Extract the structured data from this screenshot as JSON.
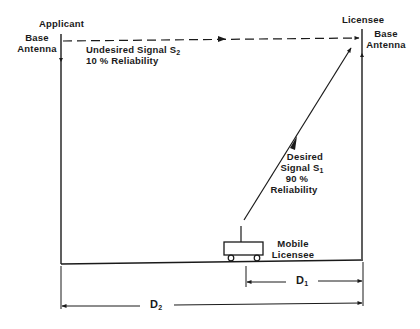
{
  "figure": {
    "applicant": {
      "title": "Applicant",
      "line1": "Base",
      "line2": "Antenna"
    },
    "licensee": {
      "title": "Licensee",
      "line1": "Base",
      "line2": "Antenna"
    },
    "undesired_signal": {
      "label": "Undesired Signal S",
      "subscript": "2",
      "reliability": "10 % Reliability"
    },
    "desired_signal": {
      "line1": "Desired",
      "label": "Signal S",
      "subscript": "1",
      "percent": "90 %",
      "reliability": "Reliability"
    },
    "mobile": {
      "line1": "Mobile",
      "line2": "Licensee"
    },
    "distances": {
      "d1_label": "D",
      "d1_sub": "1",
      "d2_label": "D",
      "d2_sub": "2"
    },
    "colors": {
      "ink": "#1a1a1a",
      "background": "#ffffff"
    }
  }
}
